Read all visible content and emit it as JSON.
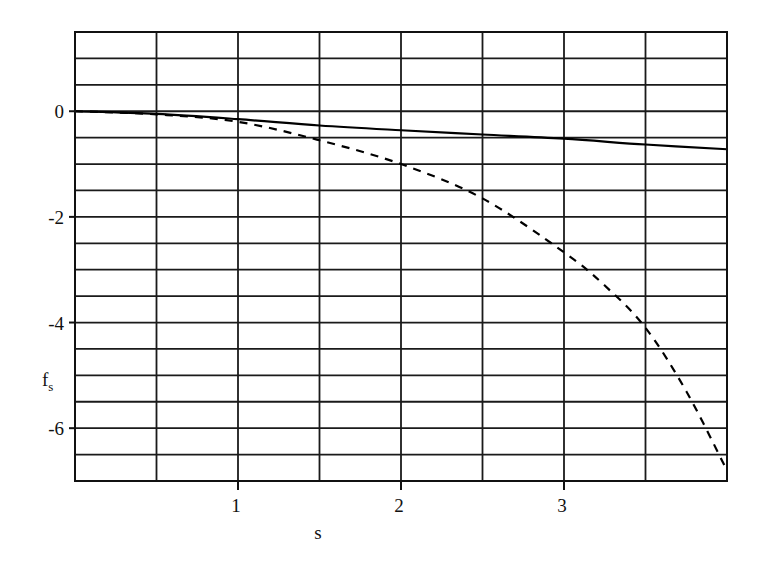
{
  "chart_data": {
    "type": "line",
    "title": "",
    "xlabel": "s",
    "ylabel": "f",
    "ylabel_subscript": "s",
    "xlim": [
      0,
      4
    ],
    "ylim": [
      -7,
      1.5
    ],
    "grid": true,
    "x_grid_step": 0.5,
    "y_grid_step": 0.5,
    "x_ticks": [
      1,
      2,
      3
    ],
    "x_tick_labels": [
      "1",
      "2",
      "3"
    ],
    "y_ticks": [
      0,
      -2,
      -4,
      -6
    ],
    "y_tick_labels": [
      "0",
      "-2",
      "-4",
      "-6"
    ],
    "legend": null,
    "series": [
      {
        "name": "solid",
        "style": "solid",
        "color": "#000000",
        "x": [
          0,
          0.5,
          1,
          1.5,
          2,
          2.5,
          3,
          3.5,
          4
        ],
        "y": [
          0,
          -0.05,
          -0.15,
          -0.27,
          -0.36,
          -0.44,
          -0.52,
          -0.63,
          -0.72
        ]
      },
      {
        "name": "dashed",
        "style": "dashed",
        "color": "#000000",
        "x": [
          0,
          0.5,
          1,
          1.5,
          2,
          2.5,
          3,
          3.25,
          3.5,
          3.75,
          4
        ],
        "y": [
          0,
          -0.06,
          -0.2,
          -0.55,
          -1.0,
          -1.65,
          -2.67,
          -3.3,
          -4.1,
          -5.3,
          -6.8
        ]
      }
    ]
  },
  "layout": {
    "plot_left": 75,
    "plot_top": 32,
    "plot_right": 727,
    "plot_bottom": 481
  }
}
